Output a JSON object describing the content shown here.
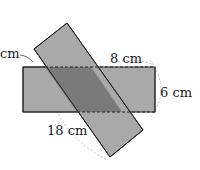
{
  "diagram": {
    "shapes": {
      "horizontal_rectangle": {
        "fill": "#a9a9a9",
        "stroke": "#222222"
      },
      "tilted_rectangle": {
        "fill": "#a9a9a9",
        "stroke": "#222222"
      },
      "overlap": {
        "fill": "#7a7a7a"
      }
    },
    "labels": {
      "top_left": "cm",
      "top_width": "8 cm",
      "right_height": "6 cm",
      "bottom_length": "18 cm"
    }
  }
}
